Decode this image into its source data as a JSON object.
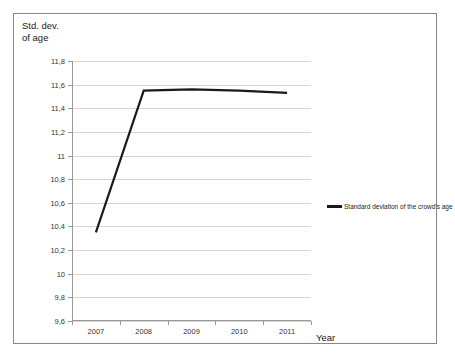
{
  "chart_data": {
    "type": "line",
    "title": "Std. dev.\nof age",
    "xlabel": "Year",
    "ylabel": "Std. dev. of age",
    "categories": [
      "2007",
      "2008",
      "2009",
      "2010",
      "2011"
    ],
    "series": [
      {
        "name": "Standard deviation of the crowd's age",
        "values": [
          10.35,
          11.55,
          11.56,
          11.55,
          11.53
        ],
        "color": "#1a1a1a"
      }
    ],
    "ylim": [
      9.6,
      11.8
    ],
    "y_ticks": [
      "9,6",
      "9,8",
      "10",
      "10,2",
      "10,4",
      "10,6",
      "10,8",
      "11",
      "11,2",
      "11,4",
      "11,6",
      "11,8"
    ],
    "y_tick_values": [
      9.6,
      9.8,
      10.0,
      10.2,
      10.4,
      10.6,
      10.8,
      11.0,
      11.2,
      11.4,
      11.6,
      11.8
    ],
    "grid": true,
    "legend_position": "right",
    "legend_entries": [
      "Standard deviation of the crowd's age"
    ],
    "decimal_separator": ",",
    "gridline_color": "#d4d4d4",
    "axis_color": "#9a9a9a",
    "frame_color": "#888888",
    "background_color": "#ffffff"
  }
}
